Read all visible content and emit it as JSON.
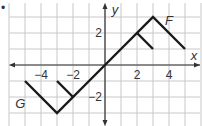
{
  "chart_data": {
    "type": "line",
    "title": "",
    "xlabel": "x",
    "ylabel": "y",
    "xlim": [
      -6,
      6
    ],
    "ylim": [
      -4,
      4
    ],
    "grid": true,
    "grid_step": 1,
    "x_ticks": [
      {
        "value": -4,
        "label": "−4"
      },
      {
        "value": -2,
        "label": "−2"
      },
      {
        "value": 2,
        "label": "2"
      },
      {
        "value": 4,
        "label": "4"
      }
    ],
    "y_ticks": [
      {
        "value": 2,
        "label": "2"
      },
      {
        "value": -2,
        "label": "−2"
      }
    ],
    "series": [
      {
        "name": "F",
        "segments": [
          [
            [
              0,
              0
            ],
            [
              3,
              3
            ],
            [
              5,
              1
            ]
          ],
          [
            [
              2,
              2
            ],
            [
              3,
              1
            ]
          ]
        ],
        "label_at": [
          4,
          2.5
        ]
      },
      {
        "name": "G",
        "segments": [
          [
            [
              -5,
              -1
            ],
            [
              -3,
              -3
            ],
            [
              0,
              0
            ]
          ],
          [
            [
              -3,
              -1
            ],
            [
              -2,
              -2
            ]
          ]
        ],
        "label_at": [
          -5.3,
          -2.7
        ]
      }
    ]
  },
  "marker": "•"
}
